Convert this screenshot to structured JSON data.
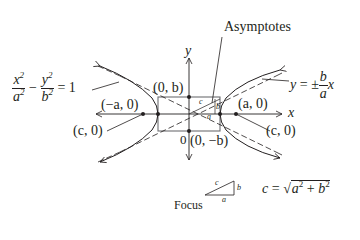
{
  "diagram": {
    "equation": {
      "x_num": "x",
      "x_den": "a",
      "y_num": "y",
      "y_den": "b",
      "exp": "2",
      "minus": "−",
      "equals": "= 1"
    },
    "asymptotes_label": "Asymptotes",
    "asymptote_equation": {
      "lhs": "y",
      "eq": "=",
      "pm": "±",
      "num": "b",
      "den": "a",
      "var": "x"
    },
    "axis_labels": {
      "x": "x",
      "y": "y",
      "origin": "0"
    },
    "points": {
      "top_vertex": "(0, b)",
      "bottom_vertex": "(0, −b)",
      "left_vertex": "(−a, 0)",
      "right_vertex": "(a, 0)",
      "left_focus": "(c, 0)",
      "right_focus": "(c, 0)"
    },
    "triangle_labels": {
      "hyp": "c",
      "vert": "b",
      "base": "a"
    },
    "focus_label": "Focus",
    "focus_formula": {
      "lhs": "c",
      "eq": "=",
      "a": "a",
      "plus": "+",
      "b": "b",
      "exp": "2"
    },
    "colors": {
      "ink": "#231f20",
      "box": "#6d6e71",
      "background": "#ffffff"
    }
  }
}
